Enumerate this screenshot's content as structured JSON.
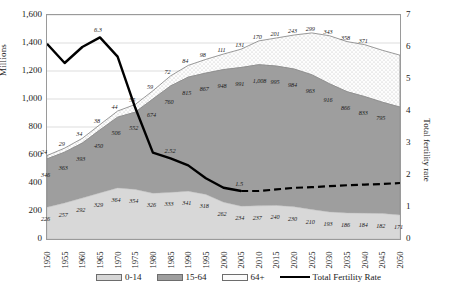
{
  "axes": {
    "left_title": "Millions",
    "right_title": "Total fertility rate",
    "left_ticks": [
      "1,600",
      "1,400",
      "1,200",
      "1,000",
      "800",
      "600",
      "400",
      "200",
      "0"
    ],
    "right_ticks": [
      "7",
      "6",
      "5",
      "4",
      "3",
      "2",
      "1",
      "0"
    ]
  },
  "legend": [
    {
      "label": "0-14",
      "color": "#d6d6d6",
      "swatch": "solid"
    },
    {
      "label": "15-64",
      "color": "#9e9e9e",
      "swatch": "solid"
    },
    {
      "label": "64+",
      "color": "#fbfbfb",
      "swatch": "solid"
    },
    {
      "label": "Total Fertility Rate",
      "color": "#000000",
      "swatch": "line"
    }
  ],
  "chart_data": {
    "type": "area",
    "title": "",
    "xlabel": "",
    "ylabel": "Millions",
    "y2label": "Total fertility rate",
    "ylim": [
      0,
      1600
    ],
    "y2lim": [
      0,
      7
    ],
    "grid": true,
    "legend_position": "bottom",
    "categories": [
      "1950",
      "1955",
      "1960",
      "1965",
      "1970",
      "1975",
      "1980",
      "1985",
      "1990",
      "1995",
      "2000",
      "2005",
      "2010",
      "2015",
      "2020",
      "2025",
      "2030",
      "2035",
      "2040",
      "2045",
      "2050"
    ],
    "series": [
      {
        "name": "0-14",
        "stack": "pop",
        "values": [
          226,
          257,
          292,
          329,
          364,
          354,
          326,
          333,
          341,
          318,
          262,
          234,
          237,
          240,
          230,
          210,
          193,
          186,
          184,
          182,
          171
        ]
      },
      {
        "name": "15-64",
        "stack": "pop",
        "values": [
          346,
          363,
          393,
          450,
          506,
          552,
          674,
          760,
          815,
          867,
          948,
          991,
          1008,
          995,
          984,
          963,
          916,
          866,
          833,
          795,
          771
        ]
      },
      {
        "name": "64+",
        "stack": "pop",
        "values": [
          24,
          29,
          34,
          38,
          44,
          55,
          59,
          72,
          84,
          98,
          111,
          131,
          170,
          201,
          243,
          299,
          343,
          358,
          371,
          371,
          371
        ]
      },
      {
        "name": "Total Fertility Rate",
        "axis": "right",
        "values": [
          6.1,
          5.5,
          6.0,
          6.3,
          5.7,
          4.1,
          2.7,
          2.52,
          2.3,
          1.9,
          1.6,
          1.5,
          1.5,
          1.55,
          1.6,
          1.62,
          1.65,
          1.68,
          1.7,
          1.72,
          1.75
        ],
        "forecast_from": "2005"
      }
    ],
    "annotations": [
      {
        "text": "6.3",
        "series": "Total Fertility Rate",
        "x": "1965"
      },
      {
        "text": "2.52",
        "series": "Total Fertility Rate",
        "x": "1985"
      },
      {
        "text": "1.5",
        "series": "Total Fertility Rate",
        "x": "2005"
      }
    ],
    "data_labels": {
      "0-14": [
        "226",
        "257",
        "292",
        "329",
        "364",
        "354",
        "326",
        "333",
        "341",
        "318",
        "262",
        "234",
        "237",
        "240",
        "230",
        "210",
        "193",
        "186",
        "184",
        "182",
        "171"
      ],
      "15-64": [
        "346",
        "363",
        "393",
        "450",
        "506",
        "552",
        "674",
        "760",
        "815",
        "867",
        "948",
        "991",
        "1,008",
        "995",
        "984",
        "963",
        "916",
        "866",
        "833",
        "795"
      ],
      "64+": [
        "24",
        "29",
        "34",
        "38",
        "44",
        "55",
        "59",
        "72",
        "84",
        "98",
        "111",
        "131",
        "170",
        "201",
        "243",
        "299",
        "343",
        "358",
        "371"
      ]
    }
  }
}
